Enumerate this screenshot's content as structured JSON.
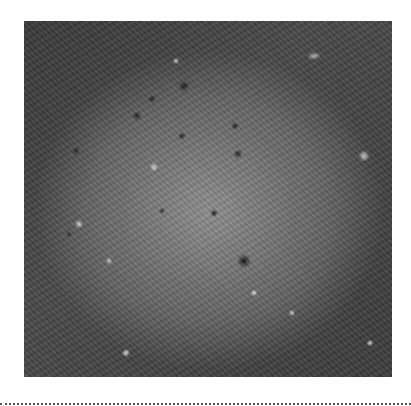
{
  "image": {
    "alt": "Grayscale orbital image of a large impact basin with bright rayed spots and dark craters",
    "subject": "cratered-planetary-surface"
  },
  "layout": {
    "separator": "dotted-line"
  },
  "colors": {
    "background": "#ffffff",
    "rim_dark": "#3a3a3a",
    "basin_light": "#969696",
    "separator": "#555555"
  }
}
